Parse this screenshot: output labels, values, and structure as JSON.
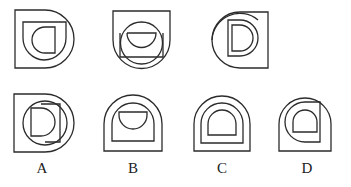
{
  "puzzle": {
    "type": "figure-series-reasoning",
    "question_row": {
      "figures": [
        {
          "index": 1,
          "description": "outer square-left/round-right D shape, inner square with rounded corner, innermost D facing left"
        },
        {
          "index": 2,
          "description": "outer shield (flat top, round bottom), circle, rectangle with half-circle inside"
        },
        {
          "index": 3,
          "description": "outer shape round-left/flat-right, circle, D letter inside"
        }
      ]
    },
    "options": [
      {
        "label": "A",
        "description": "outer D shape, circle, inner D"
      },
      {
        "label": "B",
        "description": "arch outer, arch inner, half-circle inside"
      },
      {
        "label": "C",
        "description": "three nested arches"
      },
      {
        "label": "D",
        "description": "arch outer, quarter-round shape, small D inside"
      }
    ],
    "stroke_color": "#2b2b2b",
    "background": "#ffffff"
  }
}
